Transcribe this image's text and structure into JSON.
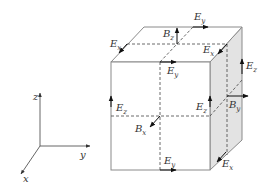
{
  "diagram": {
    "colors": {
      "edge": "#8a8a8a",
      "side_face": "#e3e3e3",
      "arrow": "#111111",
      "dashed": "#444444",
      "text": "#333333"
    },
    "axes": {
      "x_label": "x",
      "y_label": "y",
      "z_label": "z"
    },
    "labels": {
      "ey_top_back": {
        "main": "E",
        "sub": "y"
      },
      "bz_top": {
        "main": "B",
        "sub": "z"
      },
      "ex_top_left": {
        "main": "E",
        "sub": "x"
      },
      "ex_top_right": {
        "main": "E",
        "sub": "x"
      },
      "ey_top_front": {
        "main": "E",
        "sub": "y"
      },
      "ez_right_back": {
        "main": "E",
        "sub": "z"
      },
      "ez_front_left": {
        "main": "E",
        "sub": "z"
      },
      "ez_front_right": {
        "main": "E",
        "sub": "z"
      },
      "by_right": {
        "main": "B",
        "sub": "y"
      },
      "bx_front": {
        "main": "B",
        "sub": "x"
      },
      "ey_bottom_front": {
        "main": "E",
        "sub": "y"
      },
      "ex_bottom_right": {
        "main": "E",
        "sub": "x"
      }
    }
  }
}
